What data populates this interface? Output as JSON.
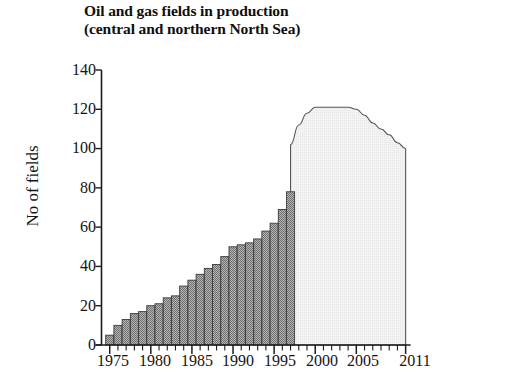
{
  "chart_data": {
    "type": "bar",
    "title": "Oil and gas fields in production (central and northern North Sea)",
    "title_line1": "Oil and gas fields in production",
    "title_line2": "(central and northern North Sea)",
    "xlabel": "",
    "ylabel": "No of fields",
    "ylim": [
      0,
      140
    ],
    "xlim": [
      1974,
      2011.5
    ],
    "grid": false,
    "legend": false,
    "ytick_labels": [
      "0",
      "20",
      "40",
      "60",
      "80",
      "100",
      "120",
      "140"
    ],
    "ytick_values": [
      0,
      20,
      40,
      60,
      80,
      100,
      120,
      140
    ],
    "xtick_labels": [
      "1975",
      "1980",
      "1985",
      "1990",
      "1995",
      "2000",
      "2005",
      "2011"
    ],
    "xtick_values": [
      1975,
      1980,
      1985,
      1990,
      1995,
      2000,
      2005,
      2011
    ],
    "minor_xticks_every": 1,
    "bar_color": "#9c9c9c",
    "bar_edge_color": "#3a3a3a",
    "projection_fill_color": "#efefef",
    "projection_edge_color": "#555555",
    "series": [
      {
        "name": "Fields in production (historical, bars)",
        "kind": "bar",
        "x": [
          1975,
          1976,
          1977,
          1978,
          1979,
          1980,
          1981,
          1982,
          1983,
          1984,
          1985,
          1986,
          1987,
          1988,
          1989,
          1990,
          1991,
          1992,
          1993,
          1994,
          1995,
          1996,
          1997
        ],
        "values": [
          5,
          10,
          13,
          16,
          17,
          20,
          21,
          24,
          25,
          30,
          33,
          36,
          39,
          41,
          45,
          50,
          51,
          52,
          54,
          58,
          62,
          69,
          78
        ]
      },
      {
        "name": "Fields in production (outlook, shaded area)",
        "kind": "area",
        "x": [
          1997,
          1998,
          1999,
          2000,
          2001,
          2002,
          2003,
          2004,
          2005,
          2006,
          2007,
          2008,
          2009,
          2010,
          2011
        ],
        "values": [
          102,
          112,
          118,
          121,
          121,
          121,
          121,
          121,
          120,
          117,
          113,
          110,
          107,
          103,
          100
        ]
      }
    ],
    "annotations": [
      {
        "text": "last bar value",
        "x": 1997,
        "y": 102
      },
      {
        "text": "plateau value",
        "x": 2002,
        "y": 121
      },
      {
        "text": "final value",
        "x": 2011,
        "y": 100
      }
    ]
  },
  "axis": {
    "y_label": "No of fields",
    "y_ticks": [
      "140",
      "120",
      "100",
      "80",
      "60",
      "40",
      "20",
      "0"
    ],
    "x_ticks": [
      "1975",
      "1980",
      "1985",
      "1990",
      "1995",
      "2000",
      "2005",
      "2011"
    ]
  }
}
